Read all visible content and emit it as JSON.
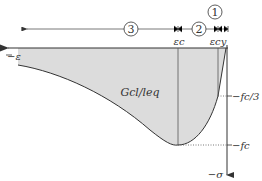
{
  "diagram": {
    "type": "stress-strain curve (compression)",
    "regions": [
      {
        "id": "region-1",
        "marker": "1"
      },
      {
        "id": "region-2",
        "marker": "2"
      },
      {
        "id": "region-3",
        "marker": "3"
      }
    ],
    "strain_labels": {
      "eps_c": "εc",
      "eps_cy": "εcy",
      "neg_eps": "−ε"
    },
    "stress_labels": {
      "fc_third": "−fc/3",
      "fc": "−fc",
      "neg_sigma": "−σ"
    },
    "area_label": "Gcl/leq",
    "colors": {
      "fill": "#dcdcdc",
      "stroke": "#333333"
    }
  }
}
